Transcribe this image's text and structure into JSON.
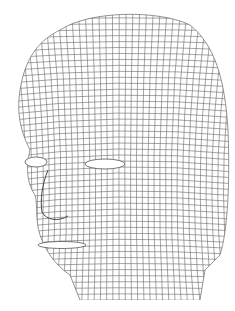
{
  "image": {
    "subject": "wireframe-head-mesh",
    "background": "#ffffff",
    "line_color": "#555555"
  }
}
